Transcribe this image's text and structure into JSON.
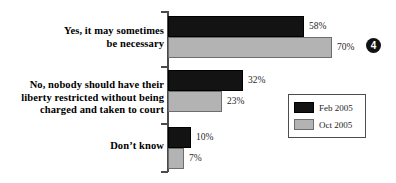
{
  "chart_data": {
    "type": "bar",
    "orientation": "horizontal",
    "title": "",
    "xlabel": "",
    "ylabel": "",
    "grid": false,
    "xlim": [
      0,
      100
    ],
    "value_suffix": "%",
    "legend_position": "middle-right",
    "categories": [
      "Yes, it may sometimes be necessary",
      "No, nobody should have their liberty restricted without being charged and taken to court",
      "Don’t know"
    ],
    "category_lines": [
      [
        "Yes, it may sometimes",
        "be necessary"
      ],
      [
        "No, nobody should have their",
        "liberty restricted without being",
        "charged and taken to court"
      ],
      [
        "Don’t know"
      ]
    ],
    "series": [
      {
        "name": "Feb 2005",
        "color": "#131313",
        "values": [
          58,
          32,
          10
        ],
        "labels": [
          "58%",
          "32%",
          "10%"
        ]
      },
      {
        "name": "Oct 2005",
        "color": "#b3b3b3",
        "values": [
          70,
          23,
          7
        ],
        "labels": [
          "70%",
          "23%",
          "7%"
        ]
      }
    ]
  },
  "legend": {
    "items": [
      {
        "label": "Feb 2005",
        "swatch": "dark"
      },
      {
        "label": "Oct 2005",
        "swatch": "light"
      }
    ]
  },
  "marker": {
    "number": "4"
  },
  "colors": {
    "series_dark": "#131313",
    "series_light": "#b3b3b3",
    "axis": "#4a4a4a",
    "text": "#000000",
    "value_text": "#2a2a2a",
    "background": "#ffffff"
  }
}
